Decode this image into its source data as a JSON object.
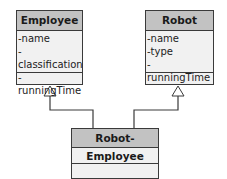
{
  "classes": {
    "employee": {
      "name": "Employee",
      "attributes": [
        "-name",
        "-classification",
        "-runningTime"
      ]
    },
    "robot": {
      "name": "Robot",
      "attributes": [
        "-name",
        "-type",
        "-runningTime"
      ]
    },
    "robot_employee": {
      "name": "Robot-Employee",
      "attributes": []
    }
  },
  "relationships": [
    {
      "type": "generalization",
      "from": "Robot-Employee",
      "to": "Employee"
    },
    {
      "type": "generalization",
      "from": "Robot-Employee",
      "to": "Robot"
    }
  ],
  "colors": {
    "header": "#c2c2c2",
    "body": "#f1f1f1",
    "line": "#3a3a3a"
  }
}
